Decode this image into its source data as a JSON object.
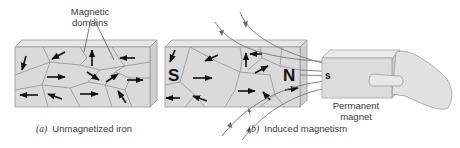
{
  "figure": {
    "panel_a": {
      "label_top": "Magnetic",
      "label_bottom": "domains",
      "caption_letter": "(a)",
      "caption_text": "Unmagnetized iron"
    },
    "panel_b": {
      "pole_left": "S",
      "pole_right": "N",
      "caption_letter": "(b)",
      "caption_text": "Induced magnetism"
    },
    "magnet": {
      "pole": "s",
      "label_top": "Permanent",
      "label_bottom": "magnet"
    }
  }
}
